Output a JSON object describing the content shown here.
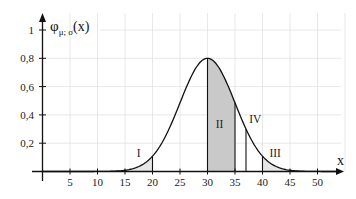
{
  "chart_data": {
    "type": "line",
    "title": "",
    "ylabel": "φ_{μ;σ}(x)",
    "ylabel_main": "φ",
    "ylabel_sub": "μ; σ",
    "ylabel_tail": "(x)",
    "xlabel": "x",
    "xlim": [
      0,
      55
    ],
    "ylim": [
      0,
      1.1
    ],
    "grid": true,
    "x_ticks": [
      5,
      10,
      15,
      20,
      25,
      30,
      35,
      40,
      45,
      50
    ],
    "x_tick_labels": [
      "5",
      "10",
      "15",
      "20",
      "25",
      "30",
      "35",
      "40",
      "45",
      "50"
    ],
    "y_ticks": [
      0.2,
      0.4,
      0.6,
      0.8,
      1
    ],
    "y_tick_labels": [
      "0,2",
      "0,4",
      "0,6",
      "0,8",
      "1"
    ],
    "curve": {
      "name": "normal density φ(μ=30; σ=5), peak 0.8",
      "mu": 30,
      "sigma": 5,
      "peak": 0.8,
      "x": [
        0,
        5,
        10,
        15,
        20,
        25,
        30,
        35,
        40,
        45,
        50,
        55
      ],
      "y": [
        0.0,
        0.0,
        0.0003,
        0.009,
        0.108,
        0.485,
        0.8,
        0.485,
        0.108,
        0.009,
        0.0003,
        0.0
      ]
    },
    "regions": [
      {
        "label": "I",
        "from": 15,
        "to": 20,
        "fill": "#e6e6e6",
        "label_x": 17.5,
        "label_y": 0.1
      },
      {
        "label": "II",
        "from": 30,
        "to": 35,
        "fill": "#c9c9c9",
        "label_x": 32.2,
        "label_y": 0.31
      },
      {
        "label": "III",
        "from": 40,
        "to": 45,
        "fill": "#e6e6e6",
        "label_x": 42.3,
        "label_y": 0.1
      },
      {
        "label": "IV",
        "from": 37,
        "to": 37,
        "fill": "none",
        "label_x": 38.7,
        "label_y": 0.34
      }
    ],
    "colors": {
      "axis": "#111111",
      "grid": "#e2e2e2",
      "region_dark": "#c9c9c9",
      "region_light": "#e6e6e6"
    }
  }
}
